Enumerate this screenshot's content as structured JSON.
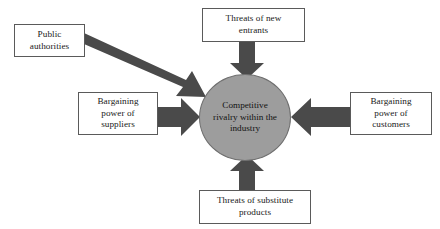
{
  "diagram": {
    "background_color": "#ffffff",
    "arrow_color": "#4a4a4a",
    "center": {
      "id": "competitive-rivalry",
      "label": "Competitive\nrivalry within the\nindustry",
      "shape": "ellipse",
      "fill_color": "#9d9d9d",
      "border_color": "#6f6f6f"
    },
    "nodes": [
      {
        "id": "public-authorities",
        "label": "Public\nauthorities",
        "shape": "rectangle",
        "fill_color": "#ffffff",
        "border_color": "#5a5a5a"
      },
      {
        "id": "new-entrants",
        "label": "Threats of new\nentrants",
        "shape": "rectangle",
        "fill_color": "#ffffff",
        "border_color": "#5a5a5a"
      },
      {
        "id": "suppliers",
        "label": "Bargaining\npower of\nsuppliers",
        "shape": "rectangle",
        "fill_color": "#ffffff",
        "border_color": "#5a5a5a"
      },
      {
        "id": "customers",
        "label": "Bargaining\npower of\ncustomers",
        "shape": "rectangle",
        "fill_color": "#ffffff",
        "border_color": "#5a5a5a"
      },
      {
        "id": "substitute-products",
        "label": "Threats of substitute\nproducts",
        "shape": "rectangle",
        "fill_color": "#ffffff",
        "border_color": "#5a5a5a"
      }
    ],
    "arrows": [
      {
        "id": "arrow-public-authorities",
        "from": "public-authorities",
        "to": "competitive-rivalry",
        "direction": "diagonal-down-right"
      },
      {
        "id": "arrow-new-entrants",
        "from": "new-entrants",
        "to": "competitive-rivalry",
        "direction": "down"
      },
      {
        "id": "arrow-suppliers",
        "from": "suppliers",
        "to": "competitive-rivalry",
        "direction": "right"
      },
      {
        "id": "arrow-customers",
        "from": "customers",
        "to": "competitive-rivalry",
        "direction": "left"
      },
      {
        "id": "arrow-substitute-products",
        "from": "substitute-products",
        "to": "competitive-rivalry",
        "direction": "up"
      }
    ]
  }
}
